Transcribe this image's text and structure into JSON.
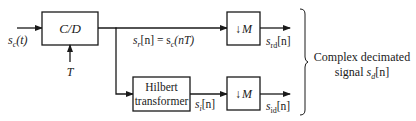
{
  "diagram": {
    "blocks": {
      "cd": {
        "label": "C/D"
      },
      "hilbert": {
        "line1": "Hilbert",
        "line2": "transformer"
      },
      "down_top": {
        "arrow": "↓",
        "label": "M"
      },
      "down_bottom": {
        "arrow": "↓",
        "label": "M"
      }
    },
    "signals": {
      "input": {
        "s": "s",
        "sub": "c",
        "arg": "(t)"
      },
      "sample_period": "T",
      "real": {
        "s": "s",
        "sub": "r",
        "arg": "[n] = s",
        "sub2": "c",
        "arg2": "(nT)"
      },
      "imag": {
        "s": "s",
        "sub": "i",
        "arg": "[n]"
      },
      "out_real": {
        "s": "s",
        "sub": "rd",
        "arg": "[n]"
      },
      "out_imag": {
        "s": "s",
        "sub": "id",
        "arg": "[n]"
      }
    },
    "output_label": {
      "line1": "Complex decimated",
      "line2_prefix": "signal ",
      "s": "s",
      "sub": "d",
      "arg": "[n]"
    },
    "colors": {
      "stroke": "#1a1a1a",
      "background": "#ffffff"
    }
  }
}
